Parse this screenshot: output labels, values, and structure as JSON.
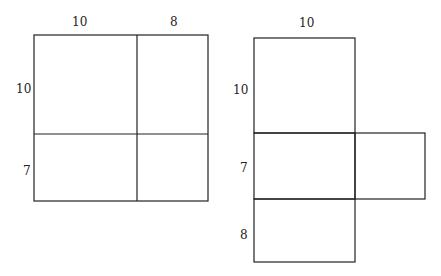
{
  "figure_left": {
    "labels": {
      "top_left": "10",
      "top_right": "8",
      "side_top": "10",
      "side_bottom": "7"
    }
  },
  "figure_right": {
    "labels": {
      "top": "10",
      "side_top": "10",
      "side_middle": "7",
      "side_bottom": "8"
    }
  },
  "colors": {
    "line": "#222222",
    "background": "#ffffff"
  }
}
